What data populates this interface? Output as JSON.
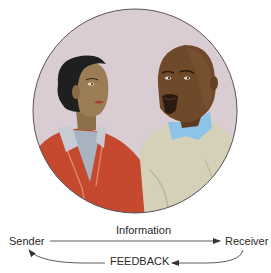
{
  "figure": {
    "illustration": {
      "subject": "two people in conversation",
      "people": [
        {
          "role": "woman",
          "position": "left",
          "outfit": "red jacket, grey-blue shirt"
        },
        {
          "role": "man",
          "position": "right",
          "outfit": "beige sweater, light blue collar"
        }
      ],
      "background_color": "#d9cdd3"
    },
    "diagram": {
      "sender": "Sender",
      "receiver": "Receiver",
      "forward_label": "Information",
      "return_label": "FEEDBACK"
    },
    "colors": {
      "text": "#2a2a2a",
      "arrow": "#333333",
      "jacket": "#c4492e",
      "sweater": "#d4d1b8",
      "collar": "#8cc3e6",
      "skin_woman": "#9b7d55",
      "skin_man": "#6f4a2a",
      "hair": "#1f1f1f"
    }
  }
}
